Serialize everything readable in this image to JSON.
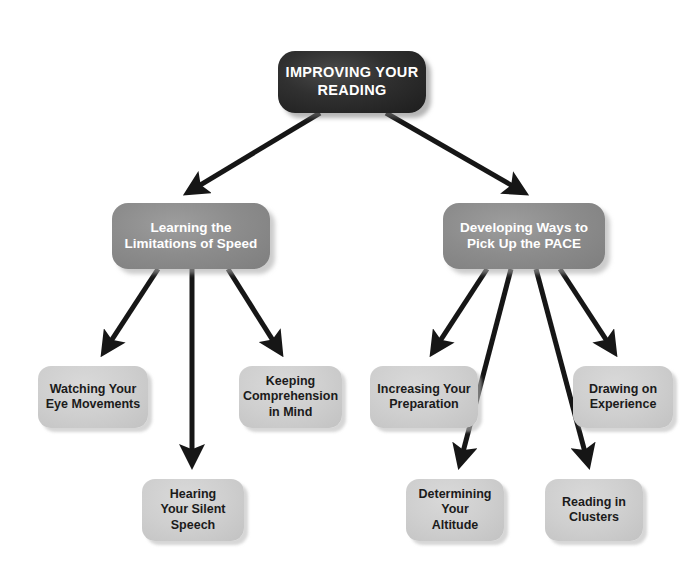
{
  "diagram": {
    "title": "Improving Your Reading",
    "type": "hierarchy-tree",
    "background_color": "#ffffff",
    "colors": {
      "root_fill": "#2b2b2b",
      "root_text": "#ffffff",
      "branch_fill": "#8c8c8c",
      "branch_text": "#ffffff",
      "leaf_fill": "#cfcfcf",
      "leaf_text": "#1b1b1b",
      "arrow": "#161616"
    },
    "nodes": [
      {
        "id": "root",
        "level": 1,
        "label": "IMPROVING YOUR\nREADING",
        "x": 278,
        "y": 51,
        "w": 148,
        "h": 62
      },
      {
        "id": "branch-left",
        "level": 2,
        "label": "Learning the\nLimitations of Speed",
        "x": 112,
        "y": 203,
        "w": 158,
        "h": 66
      },
      {
        "id": "branch-right",
        "level": 2,
        "label": "Developing Ways to\nPick Up the PACE",
        "x": 443,
        "y": 203,
        "w": 162,
        "h": 66
      },
      {
        "id": "leaf-watching-eye-movements",
        "level": 3,
        "label": "Watching Your\nEye Movements",
        "x": 38,
        "y": 366,
        "w": 110,
        "h": 62
      },
      {
        "id": "leaf-keeping-comprehension",
        "level": 3,
        "label": "Keeping\nComprehension\nin Mind",
        "x": 239,
        "y": 366,
        "w": 103,
        "h": 62
      },
      {
        "id": "leaf-hearing-silent-speech",
        "level": 4,
        "label": "Hearing\nYour Silent\nSpeech",
        "x": 142,
        "y": 479,
        "w": 102,
        "h": 62
      },
      {
        "id": "leaf-increasing-preparation",
        "level": 3,
        "label": "Increasing Your\nPreparation",
        "x": 370,
        "y": 366,
        "w": 108,
        "h": 62
      },
      {
        "id": "leaf-drawing-on-experience",
        "level": 3,
        "label": "Drawing on\nExperience",
        "x": 573,
        "y": 366,
        "w": 100,
        "h": 62
      },
      {
        "id": "leaf-determining-altitude",
        "level": 4,
        "label": "Determining\nYour\nAltitude",
        "x": 406,
        "y": 479,
        "w": 98,
        "h": 62
      },
      {
        "id": "leaf-reading-in-clusters",
        "level": 4,
        "label": "Reading in\nClusters",
        "x": 545,
        "y": 479,
        "w": 98,
        "h": 62
      }
    ],
    "edges": [
      {
        "id": "edge-root-to-branch-left",
        "from": "root",
        "to": "branch-left",
        "x1": 320,
        "y1": 113,
        "x2": 182,
        "y2": 196
      },
      {
        "id": "edge-root-to-branch-right",
        "from": "root",
        "to": "branch-right",
        "x1": 386,
        "y1": 113,
        "x2": 530,
        "y2": 196
      },
      {
        "id": "edge-branch-left-to-watching",
        "from": "branch-left",
        "to": "leaf-watching-eye-movements",
        "x1": 158,
        "y1": 269,
        "x2": 100,
        "y2": 358
      },
      {
        "id": "edge-branch-left-to-hearing",
        "from": "branch-left",
        "to": "leaf-hearing-silent-speech",
        "x1": 192,
        "y1": 269,
        "x2": 192,
        "y2": 471
      },
      {
        "id": "edge-branch-left-to-keeping",
        "from": "branch-left",
        "to": "leaf-keeping-comprehension",
        "x1": 228,
        "y1": 269,
        "x2": 284,
        "y2": 358
      },
      {
        "id": "edge-branch-right-to-increasing",
        "from": "branch-right",
        "to": "leaf-increasing-preparation",
        "x1": 487,
        "y1": 269,
        "x2": 429,
        "y2": 358
      },
      {
        "id": "edge-branch-right-to-determining",
        "from": "branch-right",
        "to": "leaf-determining-altitude",
        "x1": 511,
        "y1": 269,
        "x2": 458,
        "y2": 471
      },
      {
        "id": "edge-branch-right-to-reading",
        "from": "branch-right",
        "to": "leaf-reading-in-clusters",
        "x1": 536,
        "y1": 269,
        "x2": 590,
        "y2": 471
      },
      {
        "id": "edge-branch-right-to-drawing",
        "from": "branch-right",
        "to": "leaf-drawing-on-experience",
        "x1": 560,
        "y1": 269,
        "x2": 618,
        "y2": 358
      }
    ]
  }
}
